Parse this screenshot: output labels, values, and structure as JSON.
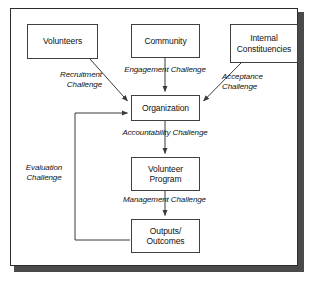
{
  "diagram": {
    "nodes": {
      "volunteers": "Volunteers",
      "community": "Community",
      "internal_constituencies_line1": "Internal",
      "internal_constituencies_line2": "Constituencies",
      "organization": "Organization",
      "volunteer_program_line1": "Volunteer",
      "volunteer_program_line2": "Program",
      "outputs_line1": "Outputs/",
      "outputs_line2": "Outcomes"
    },
    "edge_labels": {
      "recruitment": "Recruitment\nChallenge",
      "engagement": "Engagement Challenge",
      "acceptance": "Acceptance\nChallenge",
      "accountability": "Accountability Challenge",
      "management": "Management Challenge",
      "evaluation": "Evaluation\nChallenge"
    },
    "colors": {
      "box_border": "#404040",
      "frame_border": "#2b2b2b",
      "shadow": "#4a4a4a",
      "text": "#111111",
      "background": "#ffffff",
      "connector": "#3a3a3a"
    }
  }
}
